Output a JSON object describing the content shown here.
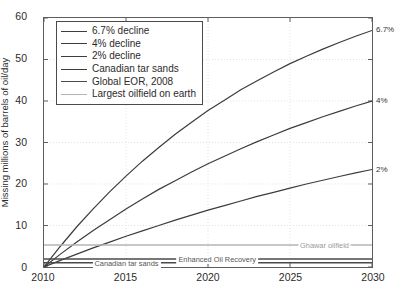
{
  "chart_data": {
    "type": "line",
    "title": "",
    "xlabel": "",
    "ylabel": "Missing millions of barrels of oil/day",
    "xlim": [
      2010,
      2030
    ],
    "ylim": [
      0,
      60
    ],
    "xticks": [
      "2010",
      "2015",
      "2020",
      "2025",
      "2030"
    ],
    "yticks": [
      "0",
      "10",
      "20",
      "30",
      "40",
      "50",
      "60"
    ],
    "grid": true,
    "legend_position": "top-left",
    "x": [
      2010,
      2011,
      2012,
      2013,
      2014,
      2015,
      2016,
      2017,
      2018,
      2019,
      2020,
      2021,
      2022,
      2023,
      2024,
      2025,
      2026,
      2027,
      2028,
      2029,
      2030
    ],
    "series": [
      {
        "name": "6.7% decline",
        "color": "#3c3c3c",
        "end_label": "6.7%",
        "values": [
          0,
          5.0,
          9.7,
          14.0,
          18.1,
          21.9,
          25.5,
          28.8,
          32.0,
          34.9,
          37.7,
          40.2,
          42.7,
          44.9,
          47.0,
          49.0,
          50.8,
          52.5,
          54.1,
          55.6,
          57.0
        ]
      },
      {
        "name": "4% decline",
        "color": "#3c3c3c",
        "end_label": "4%",
        "values": [
          0,
          3.1,
          6.0,
          8.8,
          11.4,
          14.0,
          16.4,
          18.7,
          20.8,
          22.9,
          24.9,
          26.7,
          28.5,
          30.2,
          31.8,
          33.4,
          34.8,
          36.2,
          37.5,
          38.8,
          40.0
        ]
      },
      {
        "name": "2% decline",
        "color": "#3c3c3c",
        "end_label": "2%",
        "values": [
          0,
          1.6,
          3.1,
          4.6,
          6.0,
          7.4,
          8.7,
          10.0,
          11.3,
          12.5,
          13.7,
          14.8,
          15.9,
          17.0,
          18.0,
          19.0,
          20.0,
          20.9,
          21.8,
          22.7,
          23.5
        ]
      },
      {
        "name": "Canadian tar sands",
        "color": "#4a4a4a",
        "constant": 1.0,
        "inline_label": "Canadian tar sands"
      },
      {
        "name": "Global EOR, 2008",
        "color": "#4a4a4a",
        "constant": 1.9,
        "inline_label": "Enhanced Oil Recovery"
      },
      {
        "name": "Largest oilfield on earth",
        "color": "#b4b4b4",
        "constant": 5.3,
        "inline_label": "Ghawar oilfield"
      }
    ],
    "annotations": [
      {
        "text": "Canadian tar sands",
        "x": 2015.0,
        "y": 1.0,
        "style": "dark"
      },
      {
        "text": "Enhanced Oil Recovery",
        "x": 2020.5,
        "y": 1.9,
        "style": "dark"
      },
      {
        "text": "Ghawar oilfield",
        "x": 2027.0,
        "y": 5.3,
        "style": "light"
      }
    ]
  },
  "legend": {
    "items": [
      {
        "label": "6.7% decline",
        "color": "#3c3c3c"
      },
      {
        "label": "4% decline",
        "color": "#3c3c3c"
      },
      {
        "label": "2% decline",
        "color": "#3c3c3c"
      },
      {
        "label": "Canadian tar sands",
        "color": "#3c3c3c"
      },
      {
        "label": "Global EOR, 2008",
        "color": "#4a4a4a"
      },
      {
        "label": "Largest oilfield on earth",
        "color": "#b4b4b4"
      }
    ]
  },
  "colors": {
    "axis": "#5d5d5d",
    "grid": "#e2e2e2",
    "text": "#2b2b2b",
    "background": "#ffffff"
  }
}
